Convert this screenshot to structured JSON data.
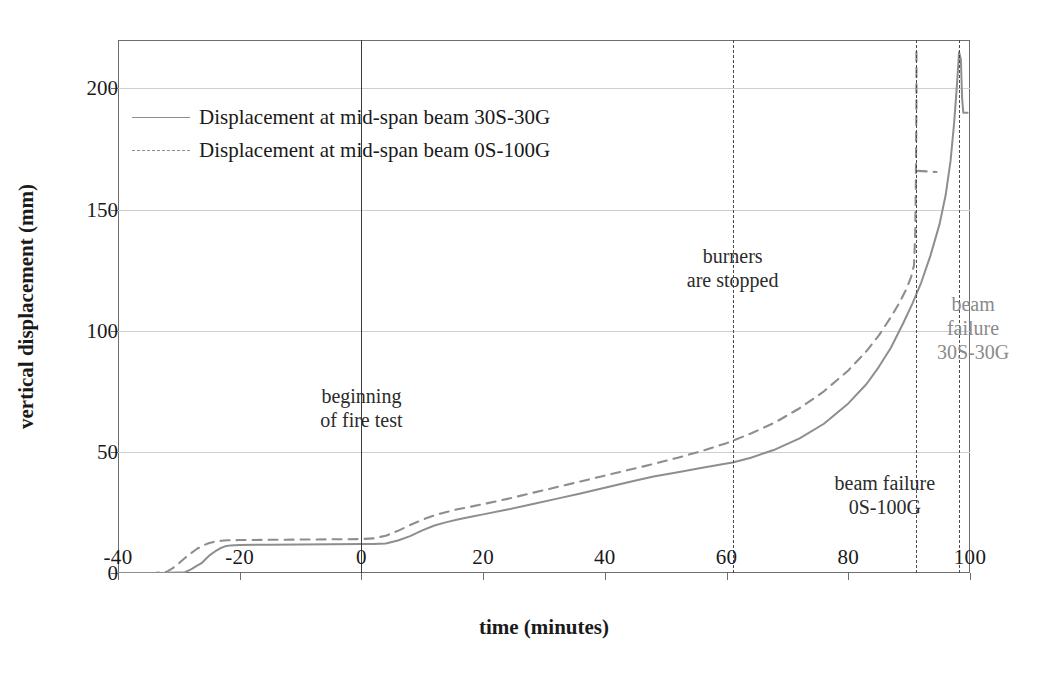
{
  "chart_data": {
    "type": "line",
    "title": "",
    "xlabel": "time (minutes)",
    "ylabel": "vertical displacement (mm)",
    "xlim": [
      -40,
      100
    ],
    "ylim": [
      0,
      220
    ],
    "xticks": [
      -40,
      -20,
      0,
      20,
      40,
      60,
      80,
      100
    ],
    "xticklabels": [
      "-40",
      "-20",
      "0",
      "20",
      "40",
      "60",
      "80",
      "100"
    ],
    "yticks": [
      0,
      50,
      100,
      150,
      200
    ],
    "yticklabels": [
      "0",
      "50",
      "100",
      "150",
      "200"
    ],
    "grid": "horizontal",
    "legend_position": "upper-left-inside",
    "series": [
      {
        "name": "Displacement at mid-span beam 30S-30G",
        "style": "solid",
        "color": "#8e8e8e",
        "points": [
          [
            -40,
            0
          ],
          [
            -33,
            0
          ],
          [
            -29,
            0.3
          ],
          [
            -28,
            1.5
          ],
          [
            -27,
            3.0
          ],
          [
            -26.2,
            4.2
          ],
          [
            -25.5,
            6.0
          ],
          [
            -24.8,
            7.6
          ],
          [
            -24,
            9.0
          ],
          [
            -23.2,
            10.2
          ],
          [
            -22.4,
            11.0
          ],
          [
            -21.5,
            11.4
          ],
          [
            -20,
            11.6
          ],
          [
            -15,
            11.7
          ],
          [
            -10,
            11.8
          ],
          [
            -5,
            11.9
          ],
          [
            0,
            12.0
          ],
          [
            2,
            12.0
          ],
          [
            4,
            12.2
          ],
          [
            6,
            13.4
          ],
          [
            8,
            15.2
          ],
          [
            10,
            17.6
          ],
          [
            12,
            19.6
          ],
          [
            14,
            21.0
          ],
          [
            16,
            22.2
          ],
          [
            18,
            23.2
          ],
          [
            20,
            24.2
          ],
          [
            24,
            26.2
          ],
          [
            28,
            28.4
          ],
          [
            32,
            30.6
          ],
          [
            36,
            32.8
          ],
          [
            40,
            35.2
          ],
          [
            44,
            37.6
          ],
          [
            48,
            39.8
          ],
          [
            52,
            41.6
          ],
          [
            56,
            43.4
          ],
          [
            60,
            45.2
          ],
          [
            61,
            45.6
          ],
          [
            64,
            47.6
          ],
          [
            68,
            51.0
          ],
          [
            72,
            55.6
          ],
          [
            76,
            61.6
          ],
          [
            80,
            70.0
          ],
          [
            83,
            78.0
          ],
          [
            85,
            85.0
          ],
          [
            87,
            93.0
          ],
          [
            89,
            103.0
          ],
          [
            90.5,
            111.0
          ],
          [
            92,
            120.0
          ],
          [
            93.5,
            131.0
          ],
          [
            95,
            144.0
          ],
          [
            96,
            156.0
          ],
          [
            96.8,
            170.0
          ],
          [
            97.4,
            186.0
          ],
          [
            97.9,
            203.0
          ],
          [
            98.2,
            215.0
          ],
          [
            98.5,
            212.0
          ],
          [
            98.7,
            196.0
          ],
          [
            98.9,
            190.0
          ],
          [
            99.6,
            190.0
          ]
        ]
      },
      {
        "name": "Displacement at mid-span beam 0S-100G",
        "style": "dashed",
        "color": "#8e8e8e",
        "points": [
          [
            -40,
            0
          ],
          [
            -34,
            0
          ],
          [
            -32,
            0.5
          ],
          [
            -31,
            2.0
          ],
          [
            -30,
            4.0
          ],
          [
            -29,
            6.2
          ],
          [
            -28,
            8.2
          ],
          [
            -27,
            10.0
          ],
          [
            -26,
            11.4
          ],
          [
            -25,
            12.4
          ],
          [
            -24,
            13.0
          ],
          [
            -23,
            13.3
          ],
          [
            -22,
            13.5
          ],
          [
            -20,
            13.6
          ],
          [
            -15,
            13.7
          ],
          [
            -10,
            13.8
          ],
          [
            -5,
            13.9
          ],
          [
            0,
            14.0
          ],
          [
            2,
            14.3
          ],
          [
            4,
            15.4
          ],
          [
            6,
            17.4
          ],
          [
            8,
            19.8
          ],
          [
            10,
            22.0
          ],
          [
            12,
            23.8
          ],
          [
            14,
            25.2
          ],
          [
            16,
            26.4
          ],
          [
            18,
            27.4
          ],
          [
            20,
            28.4
          ],
          [
            24,
            30.6
          ],
          [
            28,
            33.0
          ],
          [
            32,
            35.4
          ],
          [
            36,
            37.8
          ],
          [
            40,
            40.2
          ],
          [
            44,
            42.6
          ],
          [
            48,
            45.0
          ],
          [
            52,
            47.6
          ],
          [
            56,
            50.4
          ],
          [
            60,
            53.6
          ],
          [
            61,
            54.6
          ],
          [
            64,
            57.6
          ],
          [
            68,
            62.2
          ],
          [
            72,
            68.0
          ],
          [
            76,
            75.0
          ],
          [
            80,
            83.6
          ],
          [
            83,
            91.6
          ],
          [
            85,
            98.0
          ],
          [
            87,
            105.6
          ],
          [
            88.5,
            112.0
          ],
          [
            89.5,
            117.0
          ],
          [
            90.3,
            122.0
          ],
          [
            90.8,
            127.0
          ],
          [
            91.0,
            140.0
          ],
          [
            91.1,
            160.0
          ],
          [
            91.15,
            178.0
          ],
          [
            91.2,
            196.0
          ],
          [
            91.2,
            215.0
          ]
        ],
        "post_failure_segment": [
          [
            91.4,
            166.0
          ],
          [
            94.5,
            165.5
          ]
        ]
      }
    ],
    "event_lines": [
      {
        "name": "beginning of fire test",
        "x": 0,
        "style": "solid"
      },
      {
        "name": "burners are stopped",
        "x": 61,
        "style": "dash-dot"
      },
      {
        "name": "beam failure 0S-100G",
        "x": 91.2,
        "style": "dash-dot"
      },
      {
        "name": "beam failure 30S-30G",
        "x": 98.2,
        "style": "dash-dot"
      }
    ],
    "annotations": [
      {
        "text": "beginning\nof fire test",
        "x": 0,
        "y": 68,
        "color": "dark"
      },
      {
        "text": "burners\nare stopped",
        "x": 61,
        "y": 126,
        "color": "dark"
      },
      {
        "text": "beam failure\n30S-30G",
        "x": 100.5,
        "y": 101,
        "color": "grey"
      },
      {
        "text": "beam failure\n0S-100G",
        "x": 86,
        "y": 32,
        "color": "dark"
      }
    ],
    "colors": {
      "series_line": "#8e8e8e",
      "frame": "#6e6e6e",
      "grid": "#cfcfcf",
      "event_line": "#4a4a4a",
      "text": "#1a1a1a",
      "grey_text": "#8a8a8a",
      "background": "#ffffff"
    }
  }
}
